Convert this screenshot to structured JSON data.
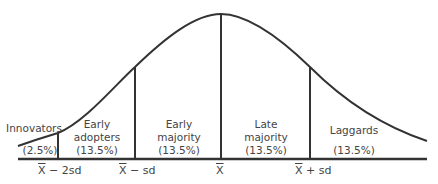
{
  "diagram": {
    "type": "normal-distribution-adoption-curve",
    "colors": {
      "line": "#333333",
      "text": "#444444",
      "background": "#ffffff"
    },
    "segments": [
      {
        "name": "Innovators",
        "line1": "Innovators",
        "line2": "",
        "percent": "(2.5%)"
      },
      {
        "name": "Early adopters",
        "line1": "Early",
        "line2": "adopters",
        "percent": "(13.5%)"
      },
      {
        "name": "Early majority",
        "line1": "Early",
        "line2": "majority",
        "percent": "(13.5%)"
      },
      {
        "name": "Late majority",
        "line1": "Late",
        "line2": "majority",
        "percent": "(13.5%)"
      },
      {
        "name": "Laggards",
        "line1": "Laggards",
        "line2": "",
        "percent": "(13.5%)"
      }
    ],
    "axis_labels": [
      {
        "mean": "X",
        "suffix": " − 2sd"
      },
      {
        "mean": "X",
        "suffix": " − sd"
      },
      {
        "mean": "X",
        "suffix": ""
      },
      {
        "mean": "X",
        "suffix": " + sd"
      }
    ]
  }
}
